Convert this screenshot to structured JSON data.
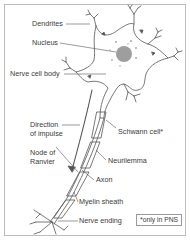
{
  "diagram": {
    "labels": {
      "dendrites": "Dendrites",
      "nucleus": "Nucleus",
      "cell_body": "Nerve cell body",
      "direction_1": "Direction",
      "direction_2": "of impulse",
      "schwann": "Schwann cell*",
      "node_1": "Node of",
      "node_2": "Ranvier",
      "neurilemma": "Neurilemma",
      "axon": "Axon",
      "myelin": "Myelin sheath",
      "ending": "Nerve ending"
    },
    "footnote": "*only in PNS",
    "colors": {
      "line": "#555555",
      "nucleus": "#9e9e9e",
      "frame": "#bdbdbd"
    }
  }
}
